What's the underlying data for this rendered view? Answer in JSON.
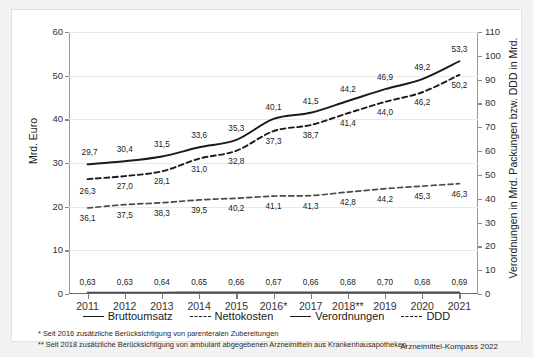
{
  "chart_data": {
    "type": "line",
    "title": "",
    "xlabel": "",
    "ylabel": "Mrd. Euro",
    "ylabel_right": "Verordnungen in Mrd. Packungen bzw. DDD in Mrd.",
    "categories": [
      "2011",
      "2012",
      "2013",
      "2014",
      "2015",
      "2016*",
      "2017",
      "2018**",
      "2019",
      "2020",
      "2021"
    ],
    "ylim": [
      0,
      60
    ],
    "yticks": [
      0,
      10,
      20,
      30,
      40,
      50,
      60
    ],
    "ylim_right": [
      0,
      110
    ],
    "yticks_right": [
      0,
      10,
      20,
      30,
      40,
      50,
      60,
      70,
      80,
      90,
      100,
      110
    ],
    "grid": true,
    "legend_position": "bottom",
    "series": [
      {
        "name": "Bruttoumsatz",
        "axis": "left",
        "style": "solid",
        "color": "#1a1a1a",
        "values": [
          29.7,
          30.4,
          31.5,
          33.6,
          35.3,
          40.1,
          41.5,
          44.2,
          46.9,
          49.2,
          53.3
        ],
        "labels": [
          "29,7",
          "30,4",
          "31,5",
          "33,6",
          "35,3",
          "40,1",
          "41,5",
          "44,2",
          "46,9",
          "49,2",
          "53,3"
        ]
      },
      {
        "name": "Nettokosten",
        "axis": "left",
        "style": "dashed",
        "color": "#1a1a1a",
        "values": [
          26.3,
          27.0,
          28.1,
          31.0,
          32.8,
          37.3,
          38.7,
          41.4,
          44.0,
          46.2,
          50.2
        ],
        "labels": [
          "26,3",
          "27,0",
          "28,1",
          "31,0",
          "32,8",
          "37,3",
          "38,7",
          "41,4",
          "44,0",
          "46,2",
          "50,2"
        ]
      },
      {
        "name": "Verordnungen",
        "axis": "right",
        "style": "solid",
        "color": "#4a4a4a",
        "values": [
          0.63,
          0.63,
          0.64,
          0.65,
          0.66,
          0.67,
          0.66,
          0.68,
          0.7,
          0.68,
          0.69
        ],
        "labels": [
          "0,63",
          "0,63",
          "0,64",
          "0,65",
          "0,66",
          "0,67",
          "0,66",
          "0,68",
          "0,70",
          "0,68",
          "0,69"
        ]
      },
      {
        "name": "DDD",
        "axis": "right",
        "style": "dashed",
        "color": "#4a4a4a",
        "values": [
          36.1,
          37.5,
          38.3,
          39.5,
          40.2,
          41.1,
          41.3,
          42.8,
          44.2,
          45.3,
          46.3
        ],
        "labels": [
          "36,1",
          "37,5",
          "38,3",
          "39,5",
          "40,2",
          "41,1",
          "41,3",
          "42,8",
          "44,2",
          "45,3",
          "46,3"
        ]
      }
    ]
  },
  "legend": {
    "items": [
      {
        "label": "Bruttoumsatz",
        "style": "solid"
      },
      {
        "label": "Nettokosten",
        "style": "dashed"
      },
      {
        "label": "Verordnungen",
        "style": "solid"
      },
      {
        "label": "DDD",
        "style": "dashed"
      }
    ]
  },
  "footnotes": [
    "*  Seit 2016 zusätzliche Berücksichtigung von parenteralen Zubereitungen",
    "** Seit 2018 zusätzliche Berücksichtigung von ambulant abgegebenen Arzneimitteln aus Krankenhausapotheken"
  ],
  "source": "Arzneimittel-Kompass 2022"
}
